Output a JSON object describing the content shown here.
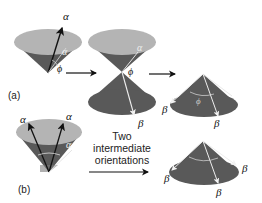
{
  "panels": {
    "a": {
      "label": "(a)",
      "step1": {
        "arrow_label": "α",
        "angle_label": "α",
        "phi_label": "ϕ"
      },
      "step2": {
        "top_label": "α",
        "phi_label": "ϕ",
        "bottom_label": "β"
      },
      "step3": {
        "phi_label": "ϕ",
        "beta_left": "β",
        "beta_bottom": "β"
      }
    },
    "b": {
      "label": "(b)",
      "step1": {
        "alpha_left": "α",
        "alpha_right": "α",
        "angle_label": "α"
      },
      "transition_line1": "Two",
      "transition_line2": "intermediate",
      "transition_line3": "orientations",
      "step2": {
        "beta_left": "β",
        "beta_right": "β",
        "beta_bottom": "β"
      }
    }
  },
  "colors": {
    "cone_light": "#b4b4b4",
    "cone_dark": "#595959",
    "cone_mid": "#7a7a7a",
    "arrow_black": "#111111",
    "arrow_white": "#f2f2f2"
  }
}
